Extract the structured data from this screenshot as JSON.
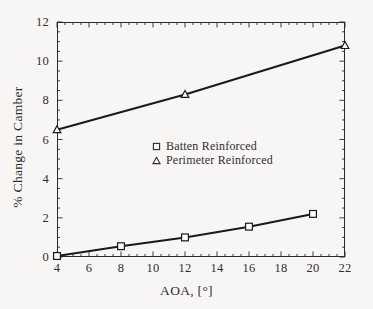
{
  "chart_data": {
    "type": "line",
    "title": "",
    "xlabel": "AOA, [°]",
    "ylabel": "% Change in Camber",
    "xlim": [
      4,
      22
    ],
    "ylim": [
      0,
      12
    ],
    "xticks": [
      4,
      6,
      8,
      10,
      12,
      14,
      16,
      18,
      20,
      22
    ],
    "yticks": [
      0,
      2,
      4,
      6,
      8,
      10,
      12
    ],
    "xtick_labels": [
      "4",
      "6",
      "8",
      "10",
      "12",
      "14",
      "16",
      "18",
      "20",
      "22"
    ],
    "ytick_labels": [
      "0",
      "2",
      "4",
      "6",
      "8",
      "10",
      "12"
    ],
    "x_minor_tick_step": 0.5,
    "y_minor_tick_step": 0.5,
    "grid": false,
    "legend_position": "center",
    "series": [
      {
        "name": "Batten Reinforced",
        "marker": "open-square",
        "color": "#1a1a1a",
        "x": [
          4,
          8,
          12,
          16,
          20
        ],
        "values": [
          0.05,
          0.55,
          1.0,
          1.55,
          2.2
        ]
      },
      {
        "name": "Perimeter Reinforced",
        "marker": "open-triangle",
        "color": "#1a1a1a",
        "x": [
          4,
          12,
          22
        ],
        "values": [
          6.5,
          8.3,
          10.8
        ]
      }
    ]
  },
  "legend": {
    "entries": [
      {
        "label": "Batten Reinforced",
        "marker": "open-square"
      },
      {
        "label": "Perimeter Reinforced",
        "marker": "open-triangle"
      }
    ]
  },
  "axes": {
    "x_title": "AOA, [°]",
    "y_title": "% Change in Camber"
  },
  "colors": {
    "background": "#f7f6f4",
    "axis": "#2b2b2b",
    "line": "#1a1a1a",
    "text": "#2e2e2e"
  }
}
